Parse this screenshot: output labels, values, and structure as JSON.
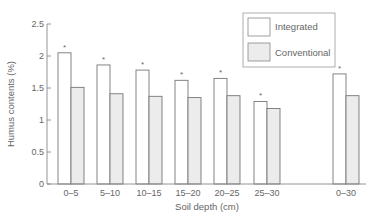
{
  "chart_data": {
    "type": "bar",
    "title": "",
    "xlabel": "Soil depth (cm)",
    "ylabel": "Humus contents (%)",
    "ylim": [
      0,
      2.5
    ],
    "yticks": [
      0,
      0.5,
      1,
      1.5,
      2,
      2.5
    ],
    "ytick_labels": [
      "0",
      "0.5",
      "1",
      "1.5",
      "2",
      "2.5"
    ],
    "categories": [
      "0–5",
      "5–10",
      "10–15",
      "15–20",
      "20–25",
      "25–30",
      "0–30"
    ],
    "series": [
      {
        "name": "Integrated",
        "color": "#ffffff",
        "values": [
          2.05,
          1.86,
          1.78,
          1.62,
          1.65,
          1.29,
          1.72
        ]
      },
      {
        "name": "Conventional",
        "color": "#ececec",
        "values": [
          1.51,
          1.41,
          1.37,
          1.35,
          1.38,
          1.18,
          1.38
        ]
      }
    ],
    "annotations": {
      "significance_marker": "*",
      "marked_series": "Integrated",
      "marked_categories": [
        "0–5",
        "5–10",
        "10–15",
        "15–20",
        "20–25",
        "25–30",
        "0–30"
      ]
    },
    "grid": false,
    "legend_position": "upper right"
  },
  "legend": {
    "items": [
      {
        "label": "Integrated"
      },
      {
        "label": "Conventional"
      }
    ]
  },
  "axes": {
    "x_title": "Soil depth (cm)",
    "y_title": "Humus contents (%)"
  },
  "colors": {
    "axis": "#888888",
    "bar_edge": "#777777",
    "integrated_fill": "#ffffff",
    "conventional_fill": "#ececec"
  }
}
